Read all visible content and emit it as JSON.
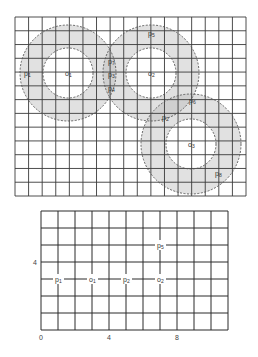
{
  "top_diagram": {
    "grid": {
      "left": 15,
      "top": 17,
      "right": 246,
      "bottom": 196,
      "cols": 17,
      "rows": 13,
      "line_color": "#3a3a3a"
    },
    "ring_fill": "#dcdcdc",
    "overlap_fill": "#c8c8c8",
    "circle_stroke": "#555555",
    "centers": [
      {
        "id": "o1",
        "base": "o",
        "sub": "1",
        "x": 68,
        "y": 73,
        "inner_r": 25,
        "outer_r": 48
      },
      {
        "id": "o2",
        "base": "o",
        "sub": "2",
        "x": 151,
        "y": 73,
        "inner_r": 25,
        "outer_r": 48
      },
      {
        "id": "o3",
        "base": "o",
        "sub": "3",
        "x": 191,
        "y": 144,
        "inner_r": 25,
        "outer_r": 50
      }
    ],
    "points": [
      {
        "id": "p1",
        "base": "p",
        "sub": "1",
        "x": 27,
        "y": 73
      },
      {
        "id": "p5",
        "base": "p",
        "sub": "5",
        "x": 151,
        "y": 33
      },
      {
        "id": "p7",
        "base": "p",
        "sub": "7",
        "x": 111,
        "y": 61
      },
      {
        "id": "p3",
        "base": "p",
        "sub": "3",
        "x": 111,
        "y": 74
      },
      {
        "id": "p4",
        "base": "p",
        "sub": "4",
        "x": 111,
        "y": 88
      },
      {
        "id": "p6",
        "base": "p",
        "sub": "6",
        "x": 192,
        "y": 100
      },
      {
        "id": "p2",
        "base": "p",
        "sub": "2",
        "x": 165,
        "y": 117
      },
      {
        "id": "p8",
        "base": "p",
        "sub": "8",
        "x": 218,
        "y": 173
      }
    ]
  },
  "bottom_diagram": {
    "origin": {
      "x": 41,
      "y": 330
    },
    "unit": 17,
    "cols": 11,
    "rows": 7,
    "tick_labels_x": [
      {
        "value": 0,
        "text": "0"
      },
      {
        "value": 4,
        "text": "4"
      },
      {
        "value": 8,
        "text": "8"
      }
    ],
    "tick_labels_y": [
      {
        "value": 4,
        "text": "4"
      }
    ],
    "points": [
      {
        "id": "p1",
        "base": "p",
        "sub": "1",
        "gx": 1,
        "gy": 3
      },
      {
        "id": "o1",
        "base": "o",
        "sub": "1",
        "gx": 3,
        "gy": 3
      },
      {
        "id": "p2",
        "base": "p",
        "sub": "2",
        "gx": 5,
        "gy": 3
      },
      {
        "id": "o2",
        "base": "o",
        "sub": "2",
        "gx": 7,
        "gy": 3
      },
      {
        "id": "p5",
        "base": "p",
        "sub": "5",
        "gx": 7,
        "gy": 5
      }
    ]
  }
}
